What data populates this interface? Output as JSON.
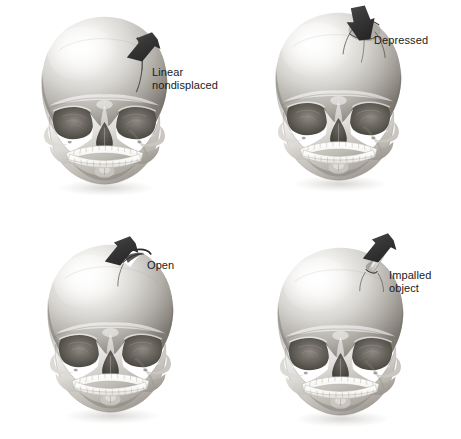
{
  "figure": {
    "type": "medical-illustration",
    "background_color": "#ffffff",
    "text_color": "#1a1a1a",
    "arrow_color": "#3a3a3a",
    "layout": "2x2 grid of anterior skull views, each with a black arrow pointing to the fracture site and a text label"
  },
  "panels": [
    {
      "id": "linear-nondisplaced",
      "label": "Linear\nnondisplaced",
      "label_lines": [
        "Linear",
        "nondisplaced"
      ],
      "arrow_direction": "down-left",
      "fracture_site": "right parietal / superior-lateral cranial vault",
      "fracture_appearance": "thin linear crack line, bone not displaced",
      "grid_position": "top-left"
    },
    {
      "id": "depressed",
      "label": "Depressed",
      "label_lines": [
        "Depressed"
      ],
      "arrow_direction": "down",
      "fracture_site": "right superior cranial vault near vertex",
      "fracture_appearance": "inwardly depressed bone fragment with dark crack margins",
      "grid_position": "top-right"
    },
    {
      "id": "open",
      "label": "Open",
      "label_lines": [
        "Open"
      ],
      "arrow_direction": "down-left",
      "fracture_site": "right superior cranial vault",
      "fracture_appearance": "open notch / break in the skull contour exposing the cranial cavity",
      "grid_position": "bottom-left"
    },
    {
      "id": "impalled-object",
      "label": "Impalled\nobject",
      "label_lines": [
        "Impalled",
        "object"
      ],
      "arrow_direction": "down-left",
      "fracture_site": "right superior cranial vault",
      "fracture_appearance": "thin pale foreign object protruding from the cranial vault",
      "grid_position": "bottom-right"
    }
  ],
  "anatomy": {
    "view": "anterior",
    "features": [
      "frontal bone",
      "orbits",
      "nasal aperture",
      "zygomatic arches",
      "maxilla with upper teeth",
      "mandible with lower teeth",
      "mental protuberance"
    ]
  }
}
